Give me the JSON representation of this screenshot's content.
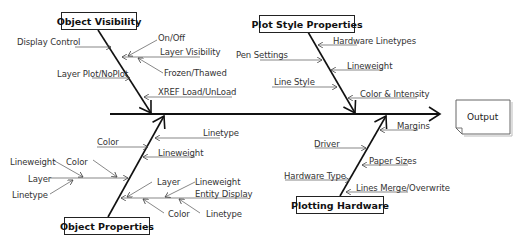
{
  "diagram": {
    "type": "fishbone",
    "effect": "Output",
    "categories": [
      {
        "name": "Object Visibility",
        "position": "top-left",
        "causes": [
          {
            "label": "Display Control",
            "sub": []
          },
          {
            "label": "Layer Visibility",
            "sub": [
              "On/Off",
              "Frozen/Thawed"
            ]
          },
          {
            "label": "Layer Plot/NoPlot",
            "sub": []
          },
          {
            "label": "XREF Load/UnLoad",
            "sub": []
          }
        ]
      },
      {
        "name": "Plot Style Properties",
        "position": "top-right",
        "causes": [
          {
            "label": "Hardware Linetypes",
            "sub": []
          },
          {
            "label": "Pen Settings",
            "sub": []
          },
          {
            "label": "Lineweight",
            "sub": []
          },
          {
            "label": "Line Style",
            "sub": []
          },
          {
            "label": "Color & Intensity",
            "sub": []
          }
        ]
      },
      {
        "name": "Object Properties",
        "position": "bottom-left",
        "causes": [
          {
            "label": "Linetype",
            "sub": []
          },
          {
            "label": "Color",
            "sub": []
          },
          {
            "label": "Lineweight",
            "sub": []
          },
          {
            "label": "Layer",
            "sub": [
              "Lineweight",
              "Color",
              "Linetype"
            ]
          },
          {
            "label": "Entity Display",
            "sub": [
              "Layer",
              "Lineweight",
              "Color",
              "Linetype"
            ]
          }
        ]
      },
      {
        "name": "Plotting Hardware",
        "position": "bottom-right",
        "causes": [
          {
            "label": "Margins",
            "sub": []
          },
          {
            "label": "Driver",
            "sub": []
          },
          {
            "label": "Paper Sizes",
            "sub": []
          },
          {
            "label": "Hardware Type",
            "sub": []
          },
          {
            "label": "Lines Merge/Overwrite",
            "sub": []
          }
        ]
      }
    ]
  },
  "labels": {
    "ov_title": "Object Visibility",
    "ov_display_control": "Display Control",
    "ov_on_off": "On/Off",
    "ov_layer_visibility": "Layer Visibility",
    "ov_frozen_thawed": "Frozen/Thawed",
    "ov_layer_plot": "Layer Plot/NoPlot",
    "ov_xref": "XREF Load/UnLoad",
    "ps_title": "Plot Style Properties",
    "ps_hw_linetypes": "Hardware Linetypes",
    "ps_pen_settings": "Pen Settings",
    "ps_lineweight": "Lineweight",
    "ps_line_style": "Line Style",
    "ps_color_intensity": "Color & Intensity",
    "op_title": "Object Properties",
    "op_linetype": "Linetype",
    "op_color": "Color",
    "op_lineweight": "Lineweight",
    "op_layer": "Layer",
    "op_layer_lineweight": "Lineweight",
    "op_layer_color": "Color",
    "op_layer_linetype": "Linetype",
    "op_entity_display": "Entity Display",
    "op_ed_layer": "Layer",
    "op_ed_lineweight": "Lineweight",
    "op_ed_color": "Color",
    "op_ed_linetype": "Linetype",
    "ph_title": "Plotting Hardware",
    "ph_margins": "Margins",
    "ph_driver": "Driver",
    "ph_paper_sizes": "Paper Sizes",
    "ph_hardware_type": "Hardware Type",
    "ph_lines_merge": "Lines Merge/Overwrite",
    "output": "Output"
  }
}
